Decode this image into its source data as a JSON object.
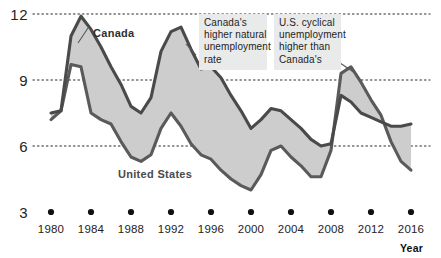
{
  "chart_data": {
    "type": "line",
    "title": "",
    "xlabel": "Year",
    "ylabel": "",
    "xlim": [
      1980,
      2016
    ],
    "ylim": [
      3,
      12
    ],
    "grid": true,
    "gridlines_y": [
      12,
      9,
      6,
      3
    ],
    "ytick_labels": [
      "12",
      "9",
      "6",
      "3"
    ],
    "xtick_labels": [
      "1980",
      "1984",
      "1988",
      "1992",
      "1996",
      "2000",
      "2004",
      "2008",
      "2012",
      "2016"
    ],
    "x": [
      1980,
      1981,
      1982,
      1983,
      1984,
      1985,
      1986,
      1987,
      1988,
      1989,
      1990,
      1991,
      1992,
      1993,
      1994,
      1995,
      1996,
      1997,
      1998,
      1999,
      2000,
      2001,
      2002,
      2003,
      2004,
      2005,
      2006,
      2007,
      2008,
      2009,
      2010,
      2011,
      2012,
      2013,
      2014,
      2015,
      2016
    ],
    "series": [
      {
        "name": "Canada",
        "color": "#4a4a4a",
        "values": [
          7.5,
          7.6,
          11.0,
          11.9,
          11.3,
          10.5,
          9.6,
          8.8,
          7.8,
          7.5,
          8.2,
          10.3,
          11.2,
          11.4,
          10.4,
          9.5,
          9.6,
          9.1,
          8.3,
          7.6,
          6.8,
          7.2,
          7.7,
          7.6,
          7.2,
          6.8,
          6.3,
          6.0,
          6.1,
          8.3,
          8.0,
          7.5,
          7.3,
          7.1,
          6.9,
          6.9,
          7.0
        ],
        "label_position": "upper-left"
      },
      {
        "name": "United States",
        "color": "#5a5a5a",
        "values": [
          7.2,
          7.6,
          9.7,
          9.6,
          7.5,
          7.2,
          7.0,
          6.2,
          5.5,
          5.3,
          5.6,
          6.8,
          7.5,
          6.9,
          6.1,
          5.6,
          5.4,
          4.9,
          4.5,
          4.2,
          4.0,
          4.7,
          5.8,
          6.0,
          5.5,
          5.1,
          4.6,
          4.6,
          5.8,
          9.3,
          9.6,
          8.9,
          8.1,
          7.4,
          6.2,
          5.3,
          4.9
        ],
        "label_position": "lower-middle"
      }
    ],
    "shaded_band": {
      "fill_color": "#cdcdcd",
      "between": [
        "Canada",
        "United States"
      ]
    },
    "annotations": [
      {
        "id": "canada-natural-unemployment",
        "lines": [
          "Canada's",
          "higher natural",
          "unemployment",
          "rate"
        ],
        "anchor_year": 1994,
        "anchor_value": 10.8
      },
      {
        "id": "us-cyclical-unemployment",
        "lines": [
          "U.S. cyclical",
          "unemployment",
          "higher than",
          "Canada's"
        ],
        "anchor_year": 2010,
        "anchor_value": 9.6
      }
    ]
  },
  "labels": {
    "canada": "Canada",
    "united_states": "United States",
    "year_axis": "Year"
  }
}
